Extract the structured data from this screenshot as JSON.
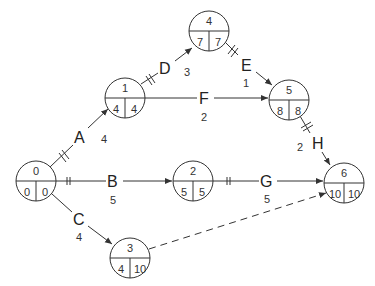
{
  "diagram": {
    "type": "activity-on-arrow network",
    "nodes": [
      {
        "id": "0",
        "es": "0",
        "lf": "0",
        "x": 36,
        "y": 181
      },
      {
        "id": "1",
        "es": "4",
        "lf": "4",
        "x": 125,
        "y": 96
      },
      {
        "id": "2",
        "es": "5",
        "lf": "5",
        "x": 193,
        "y": 178
      },
      {
        "id": "3",
        "es": "4",
        "lf": "10",
        "x": 130,
        "y": 256
      },
      {
        "id": "4",
        "es": "7",
        "lf": "7",
        "x": 209,
        "y": 29
      },
      {
        "id": "5",
        "es": "8",
        "lf": "8",
        "x": 289,
        "y": 99
      },
      {
        "id": "6",
        "es": "10",
        "lf": "10",
        "x": 344,
        "y": 183
      }
    ],
    "activities": [
      {
        "name": "A",
        "duration": "4",
        "from": "0",
        "to": "1",
        "critical": true
      },
      {
        "name": "B",
        "duration": "5",
        "from": "0",
        "to": "2",
        "critical": true
      },
      {
        "name": "C",
        "duration": "4",
        "from": "0",
        "to": "3",
        "critical": false
      },
      {
        "name": "D",
        "duration": "3",
        "from": "1",
        "to": "4",
        "critical": true
      },
      {
        "name": "E",
        "duration": "1",
        "from": "4",
        "to": "5",
        "critical": true
      },
      {
        "name": "F",
        "duration": "2",
        "from": "1",
        "to": "5",
        "critical": false
      },
      {
        "name": "G",
        "duration": "5",
        "from": "2",
        "to": "6",
        "critical": true
      },
      {
        "name": "H",
        "duration": "2",
        "from": "5",
        "to": "6",
        "critical": true
      }
    ],
    "dummy": {
      "from": "3",
      "to": "6",
      "style": "dashed"
    }
  }
}
